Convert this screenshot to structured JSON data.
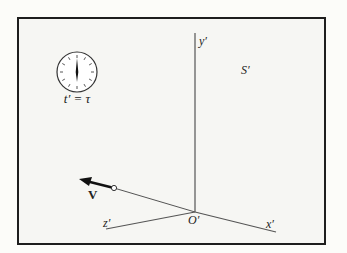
{
  "diagram": {
    "frame_label": "S′",
    "axes": {
      "y_label": "y′",
      "x_label": "x′",
      "z_label": "z′",
      "origin_label": "O′"
    },
    "clock": {
      "label": "t′ = τ",
      "hand_position": "12 o'clock"
    },
    "velocity": {
      "label": "V"
    },
    "colors": {
      "line": "#555555",
      "frame_border": "#1e1e1e",
      "background": "#f6f6f3"
    }
  }
}
